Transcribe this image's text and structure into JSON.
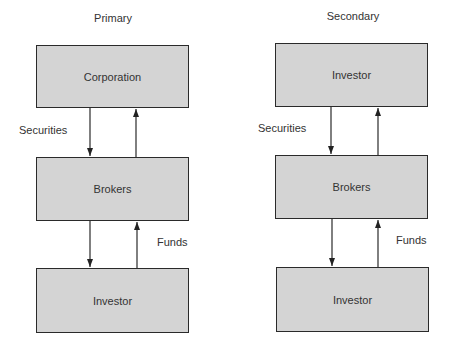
{
  "diagrams": [
    {
      "title": "Primary",
      "boxes": [
        "Corporation",
        "Brokers",
        "Investor"
      ],
      "upper_label": "Securities",
      "lower_label": "Funds"
    },
    {
      "title": "Secondary",
      "boxes": [
        "Investor",
        "Brokers",
        "Investor"
      ],
      "upper_label": "Securities",
      "lower_label": "Funds"
    }
  ],
  "colors": {
    "box_fill": "#d4d4d4",
    "stroke": "#2a2a2a"
  }
}
